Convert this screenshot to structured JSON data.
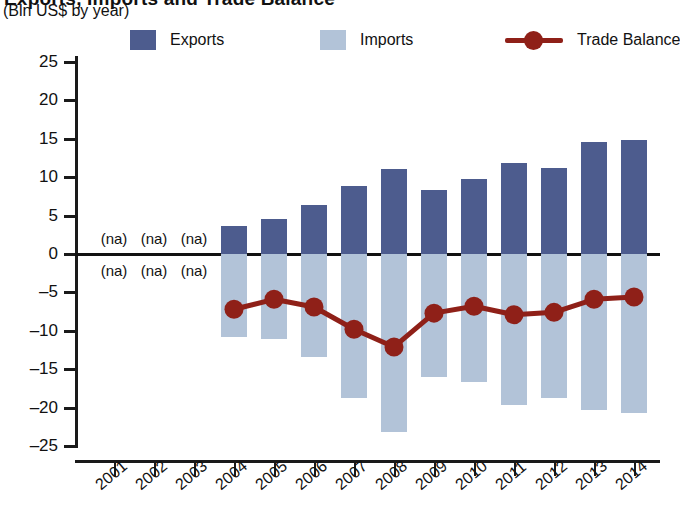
{
  "titles": {
    "main": "Exports, Imports and Trade Balance",
    "sub": "(Bln US$ by year)"
  },
  "legend": {
    "items": [
      {
        "label": "Exports",
        "type": "swatch",
        "color": "#4d5c8e"
      },
      {
        "label": "Imports",
        "type": "swatch",
        "color": "#b2c3d8"
      },
      {
        "label": "Trade Balance",
        "type": "line",
        "color": "#8f2018"
      }
    ]
  },
  "axes": {
    "y_ticks": [
      "25",
      "20",
      "15",
      "10",
      "5",
      "0",
      "-5",
      "-10",
      "-15",
      "-20",
      "-25"
    ],
    "x_ticks": [
      "2001",
      "2002",
      "2003",
      "2004",
      "2005",
      "2006",
      "2007",
      "2008",
      "2009",
      "2010",
      "2011",
      "2012",
      "2013",
      "2014"
    ]
  },
  "na_label": "(na)",
  "colors": {
    "exports": "#4d5c8e",
    "imports": "#b2c3d8",
    "trade_balance": "#8f2018",
    "axis": "#1a1a1a",
    "background": "#ffffff"
  },
  "chart_data": {
    "type": "bar",
    "title": "Exports, Imports and Trade Balance",
    "subtitle": "(Bln US$ by year)",
    "xlabel": "",
    "ylabel": "Bln US$",
    "ylim": [
      -25,
      25
    ],
    "ytick_step": 5,
    "grid": false,
    "legend_position": "top",
    "categories": [
      "2001",
      "2002",
      "2003",
      "2004",
      "2005",
      "2006",
      "2007",
      "2008",
      "2009",
      "2010",
      "2011",
      "2012",
      "2013",
      "2014"
    ],
    "series": [
      {
        "name": "Exports",
        "type": "bar",
        "color": "#4d5c8e",
        "values": [
          null,
          null,
          null,
          3.6,
          4.5,
          6.4,
          8.9,
          11.1,
          8.3,
          9.8,
          11.8,
          11.2,
          14.6,
          14.8
        ]
      },
      {
        "name": "Imports",
        "type": "bar",
        "color": "#b2c3d8",
        "values": [
          null,
          null,
          null,
          -10.8,
          -11.1,
          -13.4,
          -18.8,
          -23.2,
          -16.0,
          -16.7,
          -19.7,
          -18.8,
          -20.3,
          -20.7
        ]
      },
      {
        "name": "Trade Balance",
        "type": "line",
        "color": "#8f2018",
        "values": [
          null,
          null,
          null,
          -7.2,
          -5.9,
          -6.9,
          -9.8,
          -12.1,
          -7.7,
          -6.8,
          -7.9,
          -7.6,
          -5.9,
          -5.6
        ]
      }
    ],
    "annotations": [
      {
        "text": "(na)",
        "years": [
          "2001",
          "2002",
          "2003"
        ],
        "position": "above-zero"
      },
      {
        "text": "(na)",
        "years": [
          "2001",
          "2002",
          "2003"
        ],
        "position": "below-zero"
      }
    ]
  }
}
